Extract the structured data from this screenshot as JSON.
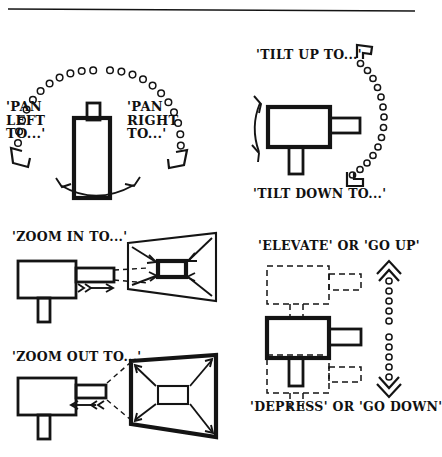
{
  "figure": {
    "type": "line-diagram",
    "background_color": "#ffffff",
    "ink_color": "#141414",
    "has_top_rule": true
  },
  "panels": [
    {
      "id": "pan",
      "name": "pan-panel",
      "view": "plan view (from above)",
      "labels": {
        "left": "'PAN\nLEFT\nTO...'",
        "right": "'PAN\nRIGHT\nTO...'"
      },
      "motion": {
        "kind": "horizontal rotation",
        "arc": "semicircular bead arc above camera",
        "bead_count": 23,
        "terminators": "open chevron arrowheads at both arc ends",
        "base_arrow": "double-headed curved arrow below camera"
      }
    },
    {
      "id": "tilt",
      "name": "tilt-panel",
      "view": "side elevation",
      "labels": {
        "up": "'TILT UP TO...'",
        "down": "'TILT DOWN TO...'"
      },
      "motion": {
        "kind": "vertical rotation",
        "arc": "vertical bead arc to the right of camera",
        "bead_count": 17,
        "terminators": "open corner brackets at both arc ends",
        "base_arrow": "double-headed curved arrow left of camera"
      }
    },
    {
      "id": "zoom_in",
      "name": "zoom-in-panel",
      "label": "'ZOOM IN TO...'",
      "motion": {
        "kind": "lens zoom in",
        "camera_arrow": "double chevron plus arrow pointing right toward frame",
        "frame": "thin outer trapezoid, thick small inner rectangle",
        "frame_arrows": "four diagonal arrows converging inward",
        "sightlines": "two dashed lines from lens to frame"
      }
    },
    {
      "id": "zoom_out",
      "name": "zoom-out-panel",
      "label": "'ZOOM OUT TO...'",
      "motion": {
        "kind": "lens zoom out",
        "camera_arrow": "arrow with double chevron pointing left away from frame",
        "frame": "thick outer rectangle, thin small inner rectangle",
        "frame_arrows": "four diagonal arrows radiating outward",
        "sightlines": "two dashed lines from lens to frame corners"
      }
    },
    {
      "id": "elevate",
      "name": "elevate-depress-panel",
      "view": "side elevation",
      "labels": {
        "top": "'ELEVATE' OR 'GO UP'",
        "bottom": "'DEPRESS' OR 'GO DOWN'"
      },
      "motion": {
        "kind": "vertical translation on mount",
        "ghosts": "dashed camera outline above and dashed camera outline below solid camera",
        "indicator": "vertical bead column with open chevron arrowheads at top and bottom",
        "bead_count": 12
      }
    }
  ]
}
